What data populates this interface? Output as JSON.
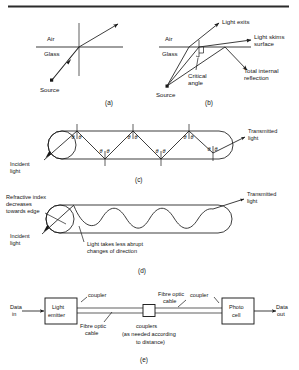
{
  "figure": {
    "panel_labels": {
      "a": "(a)",
      "b": "(b)",
      "c": "(c)",
      "d": "(d)",
      "e": "(e)"
    }
  },
  "panel_a": {
    "label_air": "Air",
    "label_glass": "Glass",
    "label_source": "Source"
  },
  "panel_b": {
    "label_air": "Air",
    "label_glass": "Glass",
    "label_source": "Source",
    "label_light_exits": "Light exits",
    "label_light_skims_1": "Light skims",
    "label_light_skims_2": "surface",
    "label_total_internal_1": "Total internal",
    "label_total_internal_2": "reflection",
    "label_critical_1": "Critical",
    "label_critical_2": "angle"
  },
  "panel_c": {
    "label_incident_1": "Incident",
    "label_incident_2": "light",
    "label_transmitted_1": "Transmitted",
    "label_transmitted_2": "light",
    "angle_symbol": "θ",
    "bounce_angle_pairs": 7
  },
  "panel_d": {
    "label_refractive_1": "Refractive index",
    "label_refractive_2": "decreases",
    "label_refractive_3": "towards edge",
    "label_incident_1": "Incident",
    "label_incident_2": "light",
    "label_transmitted_1": "Transmitted",
    "label_transmitted_2": "light",
    "label_abrupt_1": "Light takes less abrupt",
    "label_abrupt_2": "changes of direction"
  },
  "panel_e": {
    "label_data_in_1": "Data",
    "label_data_in_2": "in",
    "label_data_out_1": "Data",
    "label_data_out_2": "out",
    "block_emitter_1": "Light",
    "block_emitter_2": "emitter",
    "block_photo_1": "Photo",
    "block_photo_2": "cell",
    "label_coupler_left": "coupler",
    "label_coupler_right": "coupler",
    "label_cable_left_1": "Fibre optic",
    "label_cable_left_2": "cable",
    "label_cable_right_1": "Fibre optic",
    "label_cable_right_2": "cable",
    "label_couplers_mid_1": "couplers",
    "label_couplers_mid_2": "(as needed according",
    "label_couplers_mid_3": "to distance)"
  },
  "colors": {
    "ink": "#1b1b1b",
    "paper": "#ffffff",
    "rule": "#2b2b2b"
  }
}
